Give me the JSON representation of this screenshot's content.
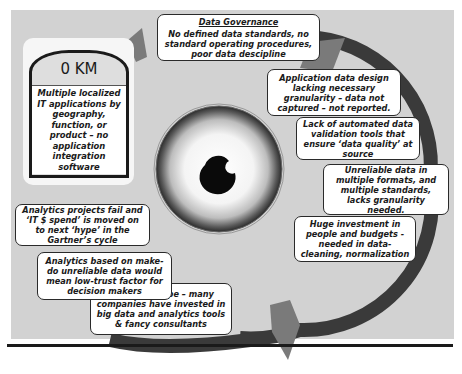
{
  "diagram": {
    "milestone": {
      "label": "0 KM",
      "description": "Multiple localized IT applications by geography, function, or product – no application integration software"
    },
    "cycle_steps": [
      {
        "id": "data-governance",
        "title": "Data Governance",
        "text": "No defined data standards, no standard operating procedures, poor data descipline"
      },
      {
        "id": "app-data-design",
        "text": "Application data design lacking necessary granularity – data not captured – not reported."
      },
      {
        "id": "validation-tools",
        "text": "Lack of automated data validation tools that ensure ‘data quality’ at source"
      },
      {
        "id": "unreliable-data",
        "text": "Unreliable data in multiple formats, and multiple standards, lacks granularity needed."
      },
      {
        "id": "huge-investment",
        "text": "Huge investment in people and budgets - needed in data-cleaning, normalization"
      },
      {
        "id": "thanks-to-hype",
        "text": "Thanks to hype – many companies have invested in big data and analytics tools & fancy consultants"
      },
      {
        "id": "make-do-analytics",
        "text": "Analytics based on make-do unreliable data would mean low-trust factor for decision makers"
      },
      {
        "id": "projects-fail",
        "text": "Analytics projects fail and ‘IT $ spend’ is moved on to next ‘hype’ in the Gartner’s cycle"
      }
    ],
    "center_image": "eye",
    "colors": {
      "background": "#d2d2d2",
      "ring": "#3a3a3a",
      "arrowhead": "#7a7a7a",
      "box_fill": "#ffffff",
      "box_border": "#2a2a2a"
    }
  }
}
